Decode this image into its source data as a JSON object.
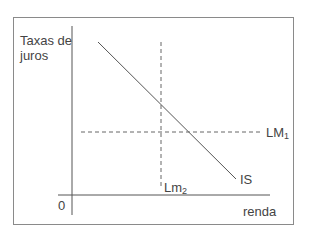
{
  "diagram": {
    "y_axis_label": "Taxas de juros",
    "y_axis_label_line1": "Taxas de",
    "y_axis_label_line2": "juros",
    "x_axis_label": "renda",
    "origin_label": "0",
    "curves": [
      {
        "name": "IS",
        "label": "IS",
        "style": "solid",
        "direction": "downward-sloping"
      },
      {
        "name": "LM1",
        "label_base": "LM",
        "label_sub": "1",
        "style": "dashed",
        "direction": "horizontal"
      },
      {
        "name": "Lm2",
        "label_base": "Lm",
        "label_sub": "2",
        "style": "dashed",
        "direction": "vertical"
      }
    ],
    "colors": {
      "line": "#555555",
      "text": "#444444",
      "frame": "#8a8a8a"
    }
  }
}
